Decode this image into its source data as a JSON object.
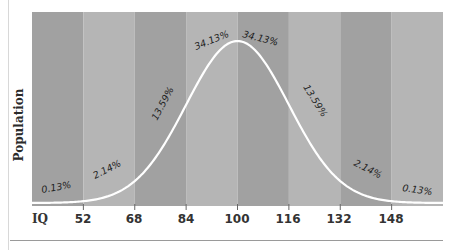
{
  "chart_data": {
    "type": "area",
    "title": "",
    "xlabel": "IQ",
    "ylabel": "Population",
    "x_ticks": [
      52,
      68,
      84,
      100,
      116,
      132,
      148
    ],
    "xlim": [
      36,
      164
    ],
    "mean": 100,
    "sd": 16,
    "bands": [
      {
        "range": "<52",
        "percent": "0.13%",
        "color": "#a1a1a1"
      },
      {
        "range": "52-68",
        "percent": "2.14%",
        "color": "#b5b5b5"
      },
      {
        "range": "68-84",
        "percent": "13.59%",
        "color": "#a1a1a1"
      },
      {
        "range": "84-100",
        "percent": "34.13%",
        "color": "#b5b5b5"
      },
      {
        "range": "100-116",
        "percent": "34.13%",
        "color": "#a1a1a1"
      },
      {
        "range": "116-132",
        "percent": "13.59%",
        "color": "#b5b5b5"
      },
      {
        "range": "132-148",
        "percent": "2.14%",
        "color": "#a1a1a1"
      },
      {
        "range": ">148",
        "percent": "0.13%",
        "color": "#b5b5b5"
      }
    ],
    "curve_color": "#ffffff",
    "grid": false,
    "legend": null
  },
  "labels": {
    "ylabel": "Population",
    "xlabel": "IQ",
    "ticks": [
      "52",
      "68",
      "84",
      "100",
      "116",
      "132",
      "148"
    ],
    "percents": [
      "0.13%",
      "2.14%",
      "13.59%",
      "34.13%",
      "34.13%",
      "13.59%",
      "2.14%",
      "0.13%"
    ]
  }
}
